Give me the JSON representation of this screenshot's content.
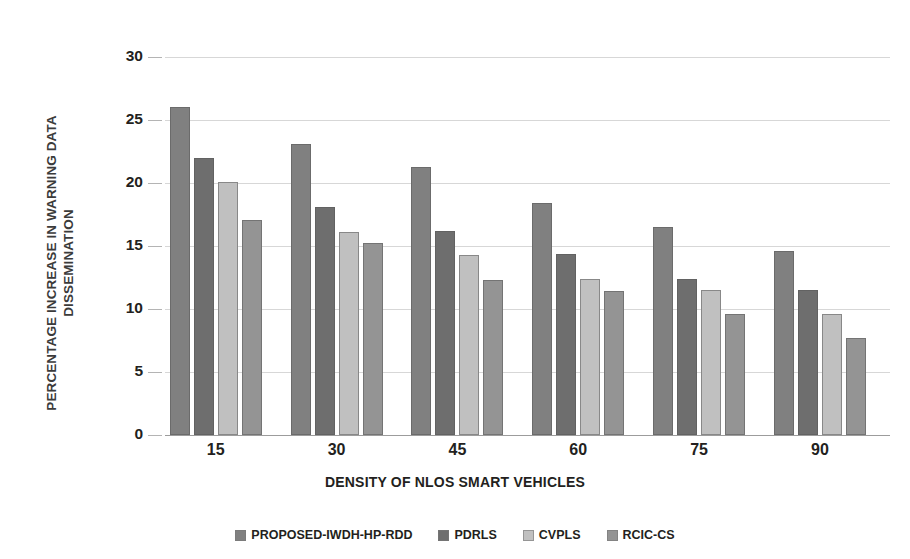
{
  "chart_data": {
    "type": "bar",
    "title": "",
    "subtitle": "",
    "xlabel": "DENSITY OF NLOS SMART VEHICLES",
    "ylabel": "PERCENTAGE INCREASE IN WARNING DATA\nDISSEMINATION",
    "categories": [
      "15",
      "30",
      "45",
      "60",
      "75",
      "90"
    ],
    "ylim": [
      0,
      30
    ],
    "yticks": [
      "0",
      "5",
      "10",
      "15",
      "20",
      "25",
      "30"
    ],
    "grid": true,
    "legend_position": "bottom",
    "series": [
      {
        "name": "PROPOSED-IWDH-HP-RDD",
        "color": "#808080",
        "values": [
          26.0,
          23.1,
          21.3,
          18.4,
          16.5,
          14.6
        ]
      },
      {
        "name": "PDRLS",
        "color": "#6e6e6e",
        "values": [
          22.0,
          18.1,
          16.2,
          14.4,
          12.4,
          11.5
        ]
      },
      {
        "name": "CVPLS",
        "color": "#c0c0c0",
        "values": [
          20.1,
          16.1,
          14.3,
          12.4,
          11.5,
          9.6
        ]
      },
      {
        "name": "RCIC-CS",
        "color": "#949494",
        "values": [
          17.1,
          15.2,
          12.3,
          11.4,
          9.6,
          7.7
        ]
      }
    ]
  },
  "style": {
    "background": "#ffffff",
    "gridline_color": "#d7d7d7",
    "axis_color": "#9c9c9c",
    "text_color": "#231f20"
  }
}
